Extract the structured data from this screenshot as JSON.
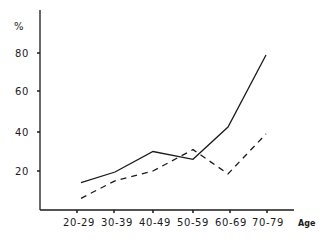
{
  "chart_data": {
    "type": "line",
    "title": "",
    "xlabel": "Age",
    "ylabel": "%",
    "categories": [
      "20-29",
      "30-39",
      "40-49",
      "50-59",
      "60-69",
      "70-79"
    ],
    "series": [
      {
        "name": "solid",
        "style": "solid",
        "values": [
          14,
          19.5,
          30,
          26,
          42.5,
          79.5
        ]
      },
      {
        "name": "dashed",
        "style": "dashed",
        "values": [
          6,
          15,
          20,
          31,
          18.5,
          39
        ]
      }
    ],
    "yticks": [
      20,
      40,
      60,
      80
    ],
    "ylim": [
      0,
      100
    ],
    "grid": false,
    "legend": null
  },
  "axes": {
    "y_label": "%",
    "x_label": "Age",
    "y_tick_labels": [
      "80",
      "60",
      "40",
      "20"
    ],
    "x_tick_labels": [
      "20-29",
      "30-39",
      "40-49",
      "50-59",
      "60-69",
      "70-79"
    ]
  }
}
